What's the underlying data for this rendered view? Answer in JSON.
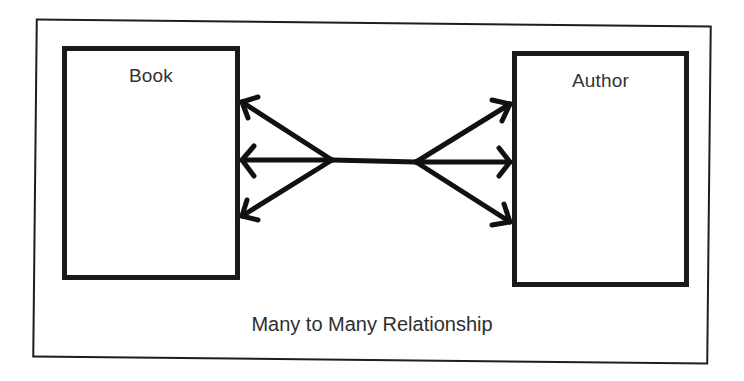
{
  "diagram": {
    "title": "Many to Many Relationship",
    "entities": [
      {
        "id": "book",
        "label": "Book"
      },
      {
        "id": "author",
        "label": "Author"
      }
    ],
    "relationship": {
      "type": "many-to-many",
      "from": "Book",
      "to": "Author",
      "left_end": "crow's foot (3 arrows)",
      "right_end": "crow's foot (3 arrows)"
    },
    "colors": {
      "stroke": "#1a1a1a",
      "text": "#333333",
      "background": "#ffffff"
    }
  }
}
